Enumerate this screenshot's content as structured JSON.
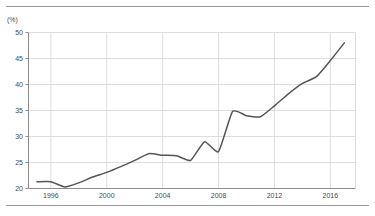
{
  "chart_data": {
    "type": "line",
    "title": "",
    "subtitle": "",
    "xlabel": "",
    "ylabel": "(%)",
    "unit_label": "(%)",
    "xlim": [
      1994.4,
      2017.8
    ],
    "ylim": [
      20,
      50
    ],
    "yticks": [
      20,
      25,
      30,
      35,
      40,
      45,
      50
    ],
    "ytick_labels": [
      "20",
      "25",
      "30",
      "35",
      "40",
      "45",
      "50"
    ],
    "xticks": [
      1996,
      2000,
      2004,
      2008,
      2012,
      2016
    ],
    "xtick_labels": [
      "1996",
      "2000",
      "2004",
      "2008",
      "2012",
      "2016"
    ],
    "grid": true,
    "grid_axis": "both",
    "legend": false,
    "legend_position": "none",
    "line_color": "#555555",
    "grid_color": "#d6d6d6",
    "axis_color": "#8c8c8c",
    "background_color": "#ffffff",
    "series": [
      {
        "name": "value",
        "x": [
          1995,
          1996,
          1997,
          1998,
          1999,
          2000,
          2001,
          2002,
          2003,
          2004,
          2005,
          2006,
          2007,
          2008,
          2009,
          2010,
          2011,
          2012,
          2013,
          2014,
          2015,
          2016,
          2017
        ],
        "values": [
          21.3,
          21.3,
          20.3,
          21.1,
          22.2,
          23.1,
          24.2,
          25.4,
          26.7,
          26.4,
          26.3,
          25.4,
          29.0,
          27.1,
          34.8,
          34.0,
          33.8,
          35.9,
          38.2,
          40.2,
          41.5,
          44.6,
          48.0
        ]
      }
    ]
  }
}
